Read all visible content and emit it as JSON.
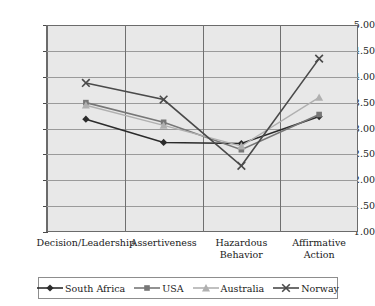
{
  "chart_data": {
    "type": "line",
    "title": "",
    "subtitle": "",
    "xlabel": "",
    "ylabel": "",
    "categories": [
      "Decision/Leadership",
      "Assertiveness",
      "Hazardous Behavior",
      "Affirmative Action"
    ],
    "category_lines": [
      [
        "Decision/Leadership"
      ],
      [
        "Assertiveness"
      ],
      [
        "Hazardous",
        "Behavior"
      ],
      [
        "Affirmative",
        "Action"
      ]
    ],
    "ylim": [
      1.0,
      5.0
    ],
    "ytick_step": 0.5,
    "yticks": [
      "5.00",
      "4.50",
      "4.00",
      "3.50",
      "3.00",
      "2.50",
      "2.00",
      "1.50",
      "1.00"
    ],
    "ytick_values": [
      5.0,
      4.5,
      4.0,
      3.5,
      3.0,
      2.5,
      2.0,
      1.5,
      1.0
    ],
    "grid": {
      "horizontal": true,
      "vertical": true
    },
    "legend_position": "bottom",
    "series": [
      {
        "name": "South Africa",
        "marker": "diamond",
        "color": "#2b2b2b",
        "values": [
          3.18,
          2.73,
          2.71,
          3.23
        ]
      },
      {
        "name": "USA",
        "marker": "square",
        "color": "#777777",
        "values": [
          3.5,
          3.12,
          2.59,
          3.27
        ]
      },
      {
        "name": "Australia",
        "marker": "triangle",
        "color": "#b0b0b0",
        "values": [
          3.45,
          3.06,
          2.66,
          3.6
        ]
      },
      {
        "name": "Norway",
        "marker": "x",
        "color": "#4a4a4a",
        "values": [
          3.88,
          3.56,
          2.28,
          4.35
        ]
      }
    ]
  },
  "plot_style": {
    "plot_background": "#e8e8e8",
    "border_color": "#6b6b6b",
    "gridline_color": "#9a9a9a",
    "page_background": "#ffffff"
  }
}
